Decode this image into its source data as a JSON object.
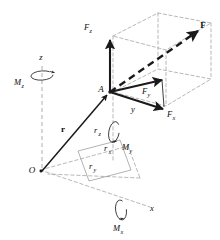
{
  "figure": {
    "colors": {
      "stroke_solid": "#1a1a1a",
      "stroke_dashed": "#9a9a9a",
      "background": "#ffffff",
      "label": "#0d0d0d"
    }
  },
  "axes": {
    "x": {
      "label": "x",
      "x": 152,
      "y": 211
    },
    "y": {
      "label": "y",
      "x": 133,
      "y": 112
    },
    "z": {
      "label": "z",
      "x": 41,
      "y": 60
    }
  },
  "points": {
    "origin": {
      "label": "O",
      "x": 32,
      "y": 173
    },
    "application": {
      "label": "A",
      "x": 101,
      "y": 92
    }
  },
  "vectors": [
    {
      "name": "force-resultant",
      "label": "F",
      "bold": true,
      "x": 203,
      "y": 28,
      "style": "dashed"
    },
    {
      "name": "force-x-component",
      "label": "F",
      "sub": "x",
      "x": 172,
      "y": 117,
      "style": "solid"
    },
    {
      "name": "force-y-component",
      "label": "F",
      "sub": "y",
      "x": 147,
      "y": 94,
      "style": "solid"
    },
    {
      "name": "force-z-component",
      "label": "F",
      "sub": "z",
      "x": 84,
      "y": 30,
      "style": "solid"
    },
    {
      "name": "position-vector",
      "label": "r",
      "bold": true,
      "x": 63,
      "y": 132,
      "style": "solid"
    }
  ],
  "distances": [
    {
      "name": "distance-rx",
      "label": "r",
      "sub": "x",
      "x": 107,
      "y": 151
    },
    {
      "name": "distance-ry",
      "label": "r",
      "sub": "y",
      "x": 92,
      "y": 169
    },
    {
      "name": "distance-rz",
      "label": "r",
      "sub": "z",
      "x": 97,
      "y": 133
    }
  ],
  "moments": [
    {
      "name": "moment-x",
      "label": "M",
      "sub": "x",
      "x": 128,
      "y": 231
    },
    {
      "name": "moment-y",
      "label": "M",
      "sub": "y",
      "x": 127,
      "y": 150
    },
    {
      "name": "moment-z",
      "label": "M",
      "sub": "z",
      "x": 18,
      "y": 85
    }
  ]
}
